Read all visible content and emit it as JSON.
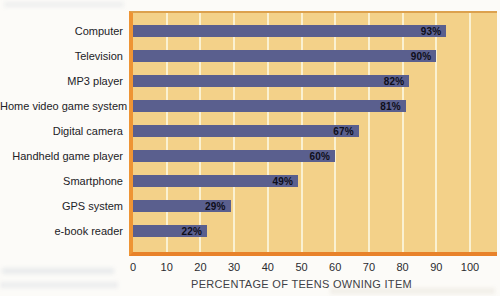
{
  "chart_data": {
    "type": "bar",
    "orientation": "horizontal",
    "title": "",
    "categories": [
      "Computer",
      "Television",
      "MP3 player",
      "Home video game system",
      "Digital camera",
      "Handheld game player",
      "Smartphone",
      "GPS system",
      "e-book reader"
    ],
    "values": [
      93,
      90,
      82,
      81,
      67,
      60,
      49,
      29,
      22
    ],
    "value_labels": [
      "93%",
      "90%",
      "82%",
      "81%",
      "67%",
      "60%",
      "49%",
      "29%",
      "22%"
    ],
    "xlabel": "PERCENTAGE OF TEENS OWNING ITEM",
    "xticks": [
      0,
      10,
      20,
      30,
      40,
      50,
      60,
      70,
      80,
      90,
      100
    ],
    "xlim": [
      0,
      108
    ],
    "grid": true,
    "legend": "none",
    "colors": {
      "plot_background": "#F3D189",
      "bar": "#5A5F8E",
      "gridline": "#FAF1D2",
      "axis_line": "#E8822A",
      "axis_left_line": "#EE9434",
      "value_label_text": "#0E0E1A",
      "category_label_text": "#222226",
      "tick_label_text": "#2B2B30"
    }
  }
}
